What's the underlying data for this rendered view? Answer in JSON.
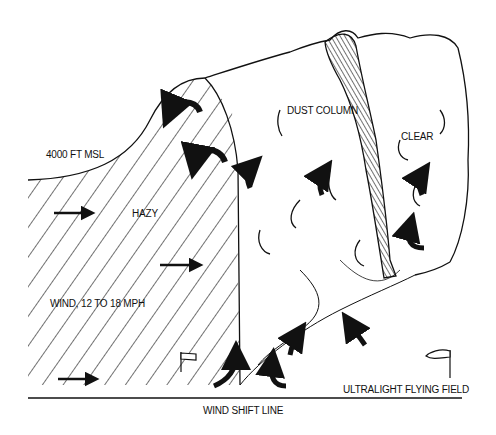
{
  "diagram": {
    "title": "",
    "colors": {
      "ink": "#111111",
      "background": "#ffffff"
    },
    "labels": {
      "altitude": "4000 FT MSL",
      "hazy": "HAZY",
      "wind": "WIND, 12 TO 18 MPH",
      "dust_column": "DUST COLUMN",
      "clear": "CLEAR",
      "wind_shift_line": "WIND SHIFT LINE",
      "flying_field": "ULTRALIGHT FLYING FIELD"
    },
    "regions": [
      {
        "name": "hazy-air-mass",
        "fill": "diagonal-hatch",
        "side": "left"
      },
      {
        "name": "clear-air-mass",
        "fill": "cloud-outline",
        "side": "right"
      },
      {
        "name": "dust-column",
        "fill": "dense-hatch",
        "side": "center-right"
      }
    ],
    "icons": [
      "wind-arrow-icon",
      "curl-arrow-icon",
      "updraft-arrow-icon",
      "windsock-icon"
    ]
  }
}
